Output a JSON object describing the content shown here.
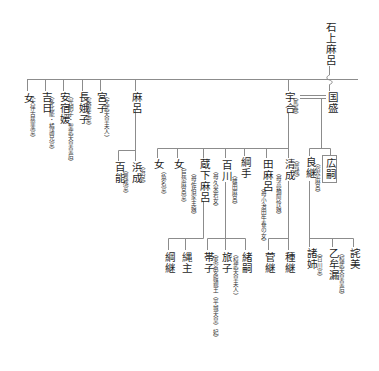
{
  "diagram": {
    "kind": "genealogy",
    "colors": {
      "text": "#1e1e1e",
      "line": "#8c8c8c",
      "background": "#ffffff"
    }
  },
  "persons": [
    {
      "name": "石上麻呂"
    },
    {
      "name": "女",
      "note": "（大伴古慈斐室）"
    },
    {
      "name": "吉日",
      "note": "（多比能・橘諸兄室）"
    },
    {
      "name": "安宿媛",
      "note": "（光明子・聖武天皇皇后）"
    },
    {
      "name": "長娥子",
      "note": "（長屋王室）"
    },
    {
      "name": "宮子",
      "note": "（文武天皇夫人）"
    },
    {
      "name": "麻呂"
    },
    {
      "name": "宇合",
      "note": "（馬養）"
    },
    {
      "name": "国盛"
    },
    {
      "name": "百能",
      "note": "（豊成室）"
    },
    {
      "name": "浜成",
      "note": "（浜足）"
    },
    {
      "name": "女",
      "note": "（魚名室）"
    },
    {
      "name": "女",
      "note": "（巨勢麻呂室）"
    },
    {
      "name": "蔵下麻呂",
      "note": "（母佐伯家主娘）"
    },
    {
      "name": "百川",
      "note": "（母久米若女）",
      "note2": "（雄田麻呂）"
    },
    {
      "name": "綱手"
    },
    {
      "name": "田麻呂",
      "note": "（母小治田牛養の女）"
    },
    {
      "name": "清成",
      "note": "（普成）",
      "note2": "（母高橋阿怜娘）"
    },
    {
      "name": "良継",
      "note": "（宿奈麻呂）"
    },
    {
      "name": "広嗣",
      "boxed": true
    },
    {
      "name": "綱継"
    },
    {
      "name": "縄主"
    },
    {
      "name": "帯子",
      "note": "（東宮安殿親王（平城天皇）妃）"
    },
    {
      "name": "旅子",
      "note": "（桓武天皇夫人）"
    },
    {
      "name": "緒嗣"
    },
    {
      "name": "菅継"
    },
    {
      "name": "種継"
    },
    {
      "name": "諸姉",
      "note": "（百川室）"
    },
    {
      "name": "乙牟漏",
      "note": "（桓武天皇皇后）"
    },
    {
      "name": "詫美"
    }
  ]
}
